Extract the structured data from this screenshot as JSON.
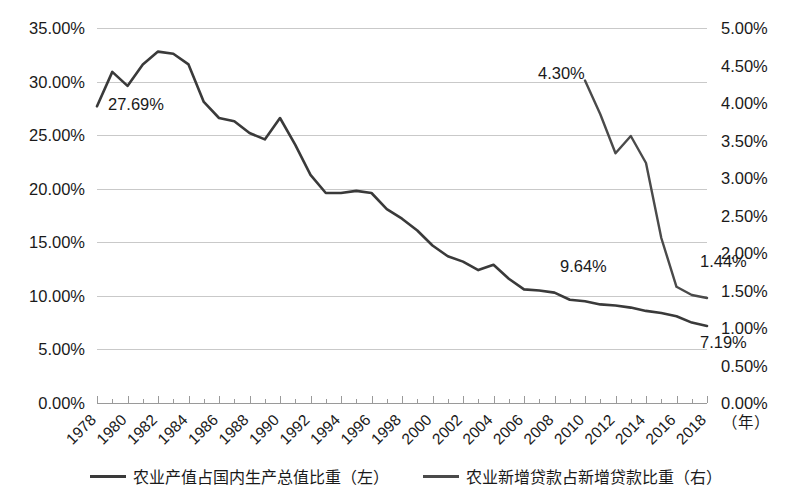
{
  "chart_data": {
    "type": "line",
    "title": "",
    "subtitle": "",
    "xlabel": "（年）",
    "grid": true,
    "legend_position": "bottom",
    "x": [
      1978,
      1979,
      1980,
      1981,
      1982,
      1983,
      1984,
      1985,
      1986,
      1987,
      1988,
      1989,
      1990,
      1991,
      1992,
      1993,
      1994,
      1995,
      1996,
      1997,
      1998,
      1999,
      2000,
      2001,
      2002,
      2003,
      2004,
      2005,
      2006,
      2007,
      2008,
      2009,
      2010,
      2011,
      2012,
      2013,
      2014,
      2015,
      2016,
      2017,
      2018
    ],
    "categories": [
      "1978",
      "1980",
      "1982",
      "1984",
      "1986",
      "1988",
      "1990",
      "1992",
      "1994",
      "1996",
      "1998",
      "2000",
      "2002",
      "2004",
      "2006",
      "2008",
      "2010",
      "2012",
      "2014",
      "2016",
      "2018"
    ],
    "left_axis": {
      "ticks": [
        "0.00%",
        "5.00%",
        "10.00%",
        "15.00%",
        "20.00%",
        "25.00%",
        "30.00%",
        "35.00%"
      ],
      "min": 0,
      "max": 35,
      "step": 5
    },
    "right_axis": {
      "ticks": [
        "0.00%",
        "0.50%",
        "1.00%",
        "1.50%",
        "2.00%",
        "2.50%",
        "3.00%",
        "3.50%",
        "4.00%",
        "4.50%",
        "5.00%"
      ],
      "min": 0,
      "max": 5,
      "step": 0.5
    },
    "series": [
      {
        "name": "农业产值占国内生产总值比重（左）",
        "axis": "left",
        "color": "#3a3a3a",
        "x": [
          1978,
          1979,
          1980,
          1981,
          1982,
          1983,
          1984,
          1985,
          1986,
          1987,
          1988,
          1989,
          1990,
          1991,
          1992,
          1993,
          1994,
          1995,
          1996,
          1997,
          1998,
          1999,
          2000,
          2001,
          2002,
          2003,
          2004,
          2005,
          2006,
          2007,
          2008,
          2009,
          2010,
          2011,
          2012,
          2013,
          2014,
          2015,
          2016,
          2017,
          2018
        ],
        "values": [
          27.69,
          30.9,
          29.6,
          31.6,
          32.8,
          32.6,
          31.6,
          28.1,
          26.6,
          26.3,
          25.2,
          24.6,
          26.6,
          24.1,
          21.3,
          19.6,
          19.6,
          19.8,
          19.6,
          18.1,
          17.2,
          16.1,
          14.7,
          13.7,
          13.2,
          12.4,
          12.9,
          11.6,
          10.6,
          10.5,
          10.3,
          9.64,
          9.5,
          9.2,
          9.1,
          8.9,
          8.6,
          8.4,
          8.1,
          7.5,
          7.19
        ],
        "labeled_points": [
          {
            "x": 1978,
            "value": 27.69,
            "label": "27.69%"
          },
          {
            "x": 2009,
            "value": 9.64,
            "label": "9.64%"
          },
          {
            "x": 2018,
            "value": 7.19,
            "label": "7.19%"
          }
        ]
      },
      {
        "name": "农业新增贷款占新增贷款比重（右）",
        "axis": "right",
        "color": "#4a4a4a",
        "x": [
          2010,
          2011,
          2012,
          2013,
          2014,
          2015,
          2016,
          2017,
          2018
        ],
        "values": [
          4.3,
          3.85,
          3.33,
          3.56,
          3.2,
          2.2,
          1.55,
          1.44,
          1.4
        ],
        "labeled_points": [
          {
            "x": 2010,
            "value": 4.3,
            "label": "4.30%"
          },
          {
            "x": 2017,
            "value": 1.44,
            "label": "1.44%"
          }
        ]
      }
    ],
    "annotations": [
      {
        "text": "27.69%",
        "x_px": 108,
        "y_px": 110
      },
      {
        "text": "4.30%",
        "x_px": 538,
        "y_px": 79
      },
      {
        "text": "9.64%",
        "x_px": 560,
        "y_px": 272
      },
      {
        "text": "1.44%",
        "x_px": 700,
        "y_px": 267
      },
      {
        "text": "7.19%",
        "x_px": 700,
        "y_px": 348
      }
    ]
  },
  "legend": {
    "items": [
      {
        "label": "农业产值占国内生产总值比重（左）",
        "color": "#3a3a3a"
      },
      {
        "label": "农业新增贷款占新增贷款比重（右）",
        "color": "#4a4a4a"
      }
    ]
  },
  "axis": {
    "x_unit": "（年）"
  }
}
